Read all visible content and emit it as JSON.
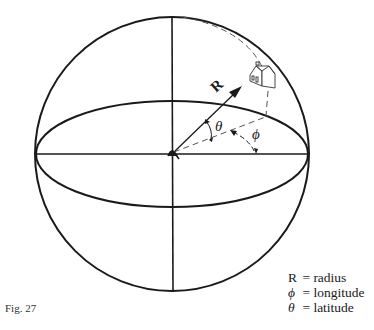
{
  "figure": {
    "caption": "Fig. 27",
    "labels": {
      "radius": "R",
      "latitude_angle": "θ",
      "longitude_angle": "ϕ"
    },
    "icons": {
      "location_marker": "house-icon"
    }
  },
  "legend": {
    "items": [
      {
        "symbol": "R",
        "eq": "=",
        "meaning": "radius"
      },
      {
        "symbol": "ϕ",
        "eq": "=",
        "meaning": "longitude"
      },
      {
        "symbol": "θ",
        "eq": "=",
        "meaning": "latitude"
      }
    ]
  },
  "colors": {
    "ink": "#1a1a1a",
    "background": "#ffffff"
  }
}
